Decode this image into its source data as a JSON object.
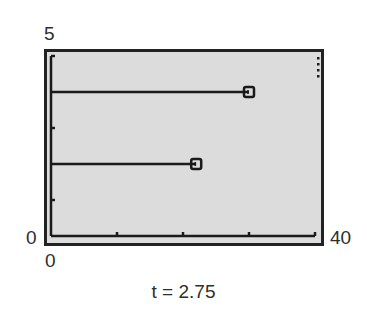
{
  "chart_data": {
    "type": "line",
    "title": "",
    "caption": "t = 2.75",
    "xlabel": "",
    "ylabel": "",
    "xlim": [
      0,
      40
    ],
    "ylim": [
      0,
      5
    ],
    "x_tick_values": [
      0,
      10,
      20,
      30,
      40
    ],
    "y_tick_values": [
      0,
      1,
      3,
      5
    ],
    "axis_labels": {
      "y_max": "5",
      "y_min": "0",
      "x_min": "0",
      "x_max": "40"
    },
    "grid": false,
    "legend": null,
    "series": [
      {
        "name": "particle-1",
        "y": 4,
        "x_start": 0,
        "x_end": 30,
        "marker": "square",
        "points": [
          [
            0,
            4
          ],
          [
            30,
            4
          ]
        ]
      },
      {
        "name": "particle-2",
        "y": 2,
        "x_start": 0,
        "x_end": 22,
        "marker": "square",
        "points": [
          [
            0,
            2
          ],
          [
            22,
            2
          ]
        ]
      }
    ],
    "busy_indicator": true
  },
  "labels": {
    "y_max": "5",
    "y_min": "0",
    "x_min": "0",
    "x_max": "40",
    "caption": "t = 2.75"
  },
  "colors": {
    "screen_bg": "#dcdcdc",
    "ink": "#1a1a1a"
  }
}
